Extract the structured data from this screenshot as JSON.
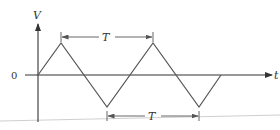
{
  "diagram": {
    "axes": {
      "y_label": "V",
      "x_label": "t",
      "origin_label": "0"
    },
    "waveform": {
      "type": "triangle",
      "points": [
        [
          38,
          75
        ],
        [
          61,
          43
        ],
        [
          107,
          107
        ],
        [
          153,
          43
        ],
        [
          199,
          107
        ],
        [
          221,
          75
        ]
      ],
      "color": "#555555"
    },
    "dimensions": [
      {
        "label": "T",
        "from": "peak 1",
        "to": "peak 2",
        "position": "top"
      },
      {
        "label": "T",
        "from": "trough 1",
        "to": "trough 2",
        "position": "bottom"
      }
    ],
    "colors": {
      "axis": "#333333",
      "waveform": "#555555",
      "dimension": "#555555",
      "baseline_shadow": "#cfcfcf"
    }
  }
}
